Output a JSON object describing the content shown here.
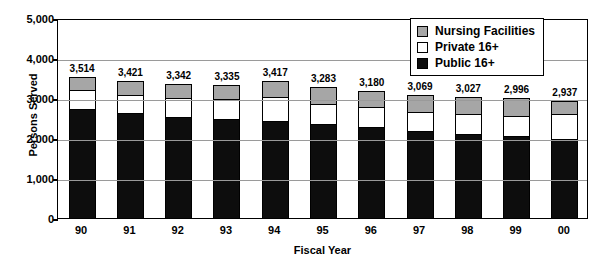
{
  "chart_data": {
    "type": "bar",
    "subtype": "stacked-vertical",
    "title": "",
    "xlabel": "Fiscal Year",
    "ylabel": "Persons Served",
    "categories": [
      "90",
      "91",
      "92",
      "93",
      "94",
      "95",
      "96",
      "97",
      "98",
      "99",
      "00"
    ],
    "ylim": [
      0,
      5000
    ],
    "ytick_values": [
      0,
      1000,
      2000,
      3000,
      4000,
      5000
    ],
    "ytick_labels": [
      "0",
      "1,000",
      "2,000",
      "3,000",
      "4,000",
      "5,000"
    ],
    "grid": "horizontal",
    "legend_position": "top-right-inside",
    "totals": [
      3514,
      3421,
      3342,
      3335,
      3417,
      3283,
      3180,
      3069,
      3027,
      2996,
      2937
    ],
    "total_labels": [
      "3,514",
      "3,421",
      "3,342",
      "3,335",
      "3,417",
      "3,283",
      "3,180",
      "3,069",
      "3,027",
      "2,996",
      "2,937"
    ],
    "series": [
      {
        "name": "Public 16+",
        "color": "#0d0d0d",
        "values": [
          2700,
          2600,
          2500,
          2450,
          2400,
          2325,
          2250,
          2150,
          2075,
          2025,
          1950
        ]
      },
      {
        "name": "Private 16+",
        "color": "#ffffff",
        "values": [
          470,
          440,
          470,
          500,
          600,
          510,
          500,
          480,
          500,
          505,
          620
        ]
      },
      {
        "name": "Nursing Facilities",
        "color": "#a6a6a6",
        "values": [
          344,
          381,
          372,
          385,
          417,
          448,
          430,
          439,
          452,
          466,
          367
        ]
      }
    ],
    "legend": [
      {
        "label": "Nursing Facilities",
        "swatch": "nursing"
      },
      {
        "label": "Private 16+",
        "swatch": "private"
      },
      {
        "label": "Public 16+",
        "swatch": "public"
      }
    ]
  }
}
